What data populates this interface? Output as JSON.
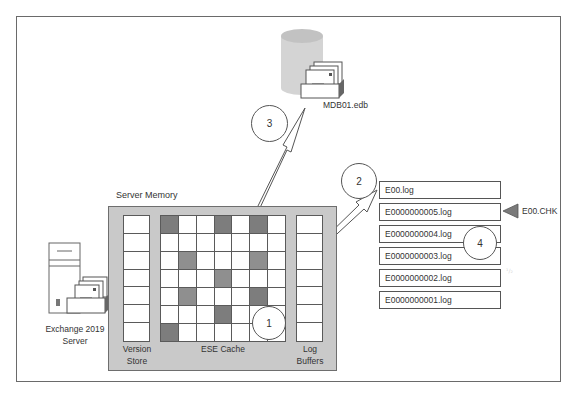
{
  "diagram": {
    "server": {
      "label_line1": "Exchange 2019",
      "label_line2": "Server",
      "icon": "server-mailbox-icon"
    },
    "database": {
      "label": "MDB01.edb",
      "icon": "database-cylinder-icon"
    },
    "server_memory": {
      "label": "Server Memory",
      "version_store": {
        "label_line1": "Version",
        "label_line2": "Store",
        "slots": 7
      },
      "ese_cache": {
        "label": "ESE Cache",
        "rows": 7,
        "cols": 7,
        "cells": [
          [
            "dark",
            "",
            "",
            "dark",
            "",
            "dark",
            ""
          ],
          [
            "",
            "",
            "",
            "",
            "",
            "",
            ""
          ],
          [
            "",
            "med",
            "",
            "",
            "",
            "med",
            ""
          ],
          [
            "",
            "",
            "",
            "med",
            "",
            "",
            ""
          ],
          [
            "",
            "med",
            "",
            "",
            "",
            "dark",
            ""
          ],
          [
            "",
            "",
            "",
            "dark",
            "",
            "",
            ""
          ],
          [
            "dark",
            "",
            "",
            "",
            "",
            "",
            ""
          ]
        ]
      },
      "log_buffers": {
        "label_line1": "Log",
        "label_line2": "Buffers",
        "slots": 7
      }
    },
    "log_files": [
      "E00.log",
      "E0000000005.log",
      "E0000000004.log",
      "E0000000003.log",
      "E0000000002.log",
      "E0000000001.log"
    ],
    "checkpoint": {
      "label": "E00.CHK",
      "points_to": "E0000000005.log"
    },
    "steps": [
      {
        "number": "1",
        "description": "Changes written to ESE cache"
      },
      {
        "number": "2",
        "description": "Log buffers flushed to current log E00.log"
      },
      {
        "number": "3",
        "description": "Dirty pages written to database MDB01.edb"
      },
      {
        "number": "4",
        "description": "Checkpoint file tracks committed logs"
      }
    ],
    "colors": {
      "memory_fill": "#c9c9c9",
      "dark_cell": "#7d7d7d",
      "medium_cell": "#8f8f8f",
      "border": "#5a5a5a",
      "database_fill": "#d4d4d4"
    }
  }
}
